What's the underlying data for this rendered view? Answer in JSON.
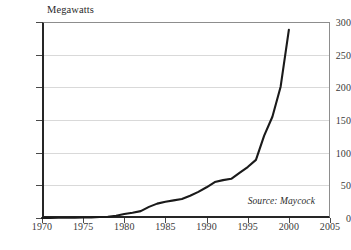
{
  "chart_data": {
    "type": "line",
    "title": "",
    "ylabel": "Megawatts",
    "xlabel": "",
    "xlim": [
      1970,
      2005
    ],
    "ylim": [
      0,
      300
    ],
    "grid": true,
    "legend": false,
    "ytick_labels": [
      "0",
      "50",
      "100",
      "150",
      "200",
      "250",
      "300"
    ],
    "ytick_values": [
      0,
      50,
      100,
      150,
      200,
      250,
      300
    ],
    "xtick_labels": [
      "1970",
      "1975",
      "1980",
      "1985",
      "1990",
      "1995",
      "2000",
      "2005"
    ],
    "xtick_values": [
      1970,
      1975,
      1980,
      1985,
      1990,
      1995,
      2000,
      2005
    ],
    "annotations": [
      {
        "text": "Source: Maycock",
        "position": "bottom-right-inside-plot",
        "style": "italic"
      }
    ],
    "series": [
      {
        "name": "World Photovoltaic Production",
        "color": "#1a1a1a",
        "x": [
          1970,
          1971,
          1972,
          1973,
          1974,
          1975,
          1976,
          1977,
          1978,
          1979,
          1980,
          1981,
          1982,
          1983,
          1984,
          1985,
          1986,
          1987,
          1988,
          1989,
          1990,
          1991,
          1992,
          1993,
          1994,
          1995,
          1996,
          1997,
          1998,
          1999,
          2000
        ],
        "values": [
          0.1,
          0.2,
          0.3,
          0.4,
          0.6,
          0.8,
          1.0,
          1.5,
          2.0,
          3.5,
          6.0,
          8.0,
          10.5,
          17.0,
          22.0,
          25.0,
          27.0,
          29.0,
          34.0,
          40.0,
          47.0,
          55.0,
          58.0,
          60.0,
          69.0,
          78.0,
          89.0,
          126.0,
          155.0,
          201.0,
          288.0
        ]
      }
    ]
  }
}
